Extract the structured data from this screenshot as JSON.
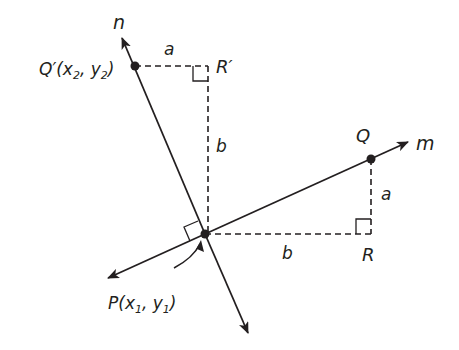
{
  "figure": {
    "lines": {
      "m": {
        "label": "m"
      },
      "n": {
        "label": "n"
      }
    },
    "points": {
      "P": {
        "label_main": "P(x",
        "sub1": "1",
        "mid": ", y",
        "sub2": "1",
        "end": ")"
      },
      "Q": {
        "label": "Q"
      },
      "Q_prime": {
        "label_main": "Q′(x",
        "sub1": "2",
        "mid": ", y",
        "sub2": "2",
        "end": ")"
      },
      "R": {
        "label": "R"
      },
      "R_prime": {
        "label": "R′"
      }
    },
    "segments": {
      "a_bottom": "a",
      "a_top": "a",
      "b_bottom": "b",
      "b_vertical": "b"
    },
    "colors": {
      "stroke": "#231f20",
      "background": "#ffffff"
    }
  }
}
